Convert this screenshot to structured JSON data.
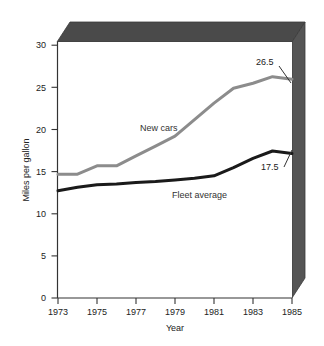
{
  "chart_data": {
    "type": "line",
    "title": "",
    "xlabel": "Year",
    "ylabel": "Miles per gallon",
    "xlim": [
      1973,
      1985
    ],
    "ylim": [
      0,
      31
    ],
    "yticks": [
      0,
      5,
      10,
      15,
      20,
      25,
      30
    ],
    "xticks": [
      1973,
      1975,
      1977,
      1979,
      1981,
      1983,
      1985
    ],
    "grid": false,
    "legend": "inline-labels",
    "style": "3d-block-frame",
    "x": [
      1973,
      1974,
      1975,
      1976,
      1977,
      1978,
      1979,
      1980,
      1981,
      1982,
      1983,
      1984,
      1985
    ],
    "series": [
      {
        "name": "New cars",
        "color": "#8c8c8c",
        "values": [
          15.0,
          15.0,
          16.0,
          16.0,
          17.2,
          18.4,
          19.6,
          21.6,
          23.6,
          25.4,
          26.0,
          26.8,
          26.5
        ],
        "end_label": "26.5"
      },
      {
        "name": "Fleet average",
        "color": "#1a1a1a",
        "values": [
          13.0,
          13.4,
          13.7,
          13.8,
          14.0,
          14.1,
          14.3,
          14.5,
          14.8,
          15.8,
          16.9,
          17.8,
          17.5
        ],
        "end_label": "17.5"
      }
    ],
    "annotations": [
      {
        "text": "New cars",
        "x": 1976.9,
        "y": 21.2
      },
      {
        "text": "Fleet average",
        "x": 1979.6,
        "y": 13.2
      },
      {
        "text": "26.5",
        "x": 1983.4,
        "y": 28.3
      },
      {
        "text": "17.5",
        "x": 1983.6,
        "y": 16.4
      }
    ],
    "colors": {
      "new_cars": "#8c8c8c",
      "fleet_average": "#1a1a1a",
      "frame_top": "#4a4a4a",
      "frame_right": "#555555",
      "axis": "#333333",
      "background": "#ffffff"
    }
  },
  "tick_labels": {
    "y": [
      "30",
      "25",
      "20",
      "15",
      "10",
      "5",
      "0"
    ],
    "x": [
      "1973",
      "1975",
      "1977",
      "1979",
      "1981",
      "1983",
      "1985"
    ]
  },
  "labels": {
    "y_axis_title": "Miles per gallon",
    "x_axis_title": "Year",
    "new_cars": "New cars",
    "fleet_average": "Fleet average",
    "new_cars_end_value": "26.5",
    "fleet_average_end_value": "17.5"
  }
}
